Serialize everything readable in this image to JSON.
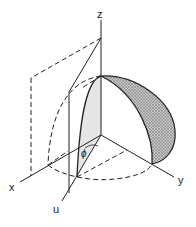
{
  "figure": {
    "labels": {
      "z": "z",
      "x": "x",
      "y": "y",
      "u": "u",
      "angle": "ϕ"
    },
    "colors": {
      "line": "#222222",
      "slice_fill": "#e2e2e2",
      "shell_fill": "#b8b8b8"
    }
  }
}
